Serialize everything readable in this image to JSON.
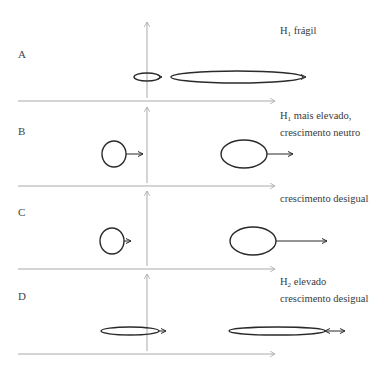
{
  "colors": {
    "axis": "#a9a9a9",
    "shape": "#2a2a2a",
    "text": "#3a3a3a"
  },
  "panels": [
    {
      "label": "A",
      "caption": {
        "prefix": "H",
        "sub": "1",
        "lines": [
          " frágil"
        ]
      },
      "shapes": [
        {
          "type": "ellipse",
          "cx": 147,
          "cy": 77,
          "rx": 13,
          "ry": 4,
          "arrow": {
            "x1": 160,
            "x2": 162,
            "style": "single"
          }
        },
        {
          "type": "ellipse",
          "cx": 237,
          "cy": 77,
          "rx": 66,
          "ry": 6,
          "arrow": {
            "x1": 303,
            "x2": 306,
            "style": "single"
          }
        }
      ]
    },
    {
      "label": "B",
      "caption": {
        "prefix": "H",
        "sub": "1",
        "lines": [
          " mais elevado,",
          "crescimento neutro"
        ]
      },
      "shapes": [
        {
          "type": "circle",
          "cx": 114,
          "cy": 154,
          "rx": 12,
          "ry": 13,
          "arrow": {
            "x1": 126,
            "x2": 143,
            "style": "single"
          }
        },
        {
          "type": "ellipse",
          "cx": 244,
          "cy": 154,
          "rx": 23,
          "ry": 14,
          "arrow": {
            "x1": 267,
            "x2": 293,
            "style": "single"
          }
        }
      ]
    },
    {
      "label": "C",
      "caption": {
        "prefix": "",
        "sub": "",
        "lines": [
          "crescimento desigual"
        ]
      },
      "shapes": [
        {
          "type": "circle",
          "cx": 112,
          "cy": 241,
          "rx": 12,
          "ry": 13,
          "arrow": {
            "x1": 124,
            "x2": 131,
            "style": "single"
          }
        },
        {
          "type": "ellipse",
          "cx": 253,
          "cy": 241,
          "rx": 23,
          "ry": 14,
          "arrow": {
            "x1": 276,
            "x2": 327,
            "style": "single"
          }
        }
      ]
    },
    {
      "label": "D",
      "caption": {
        "prefix": "H",
        "sub": "2",
        "lines": [
          " elevado",
          "crescimento desigual"
        ]
      },
      "shapes": [
        {
          "type": "ellipse",
          "cx": 130,
          "cy": 331,
          "rx": 29,
          "ry": 4,
          "arrow": {
            "x1": 159,
            "x2": 166,
            "style": "single"
          }
        },
        {
          "type": "ellipse",
          "cx": 277,
          "cy": 331,
          "rx": 48,
          "ry": 4,
          "arrow": {
            "x1": 325,
            "x2": 345,
            "style": "double"
          }
        }
      ]
    }
  ]
}
